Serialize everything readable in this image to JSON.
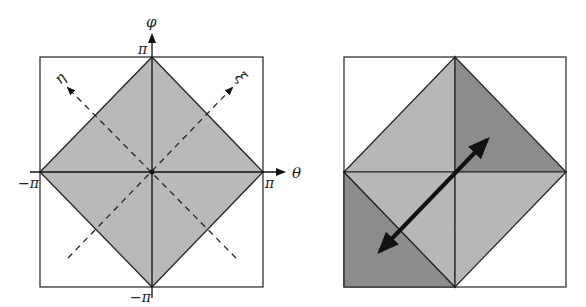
{
  "figure": {
    "left_panel": {
      "title": "",
      "axes": {
        "horizontal_label": "θ",
        "vertical_label": "φ",
        "diagonal_left_label": "η",
        "diagonal_right_label": "ξ"
      },
      "ticks": {
        "top": "π",
        "bottom": "−π",
        "left": "−π",
        "right": "π"
      },
      "region": "diamond |θ|+|φ| ≤ π shaded",
      "colors": {
        "fill": "#b9b9b9",
        "stroke": "#222222",
        "frame": "#333333"
      }
    },
    "right_panel": {
      "regions": [
        {
          "name": "top-left triangle",
          "shade": "light"
        },
        {
          "name": "top-right triangle",
          "shade": "dark"
        },
        {
          "name": "bottom-left triangle",
          "shade": "light"
        },
        {
          "name": "bottom-left corner",
          "shade": "dark"
        },
        {
          "name": "bottom-right triangle",
          "shade": "light"
        }
      ],
      "arrow": "double-headed along diagonal",
      "colors": {
        "light": "#b7b7b7",
        "dark": "#8c8c8c",
        "stroke": "#222222"
      }
    }
  }
}
